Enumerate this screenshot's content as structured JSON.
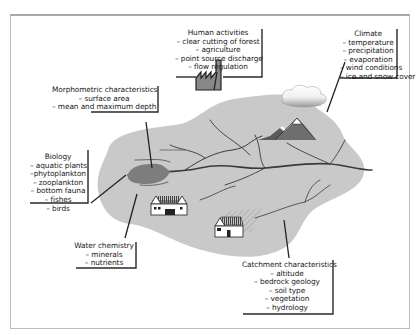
{
  "diagram": {
    "type": "lake catchment factors illustration",
    "colors": {
      "catchment_fill": "#c9c9c9",
      "lake_fill": "#7d7d7d",
      "river_stroke": "#3a3a3a",
      "label_shadow": "#2a2a2a",
      "frame_border": "#b0b0b0"
    },
    "labels": {
      "human": {
        "title": "Human activities",
        "items": [
          "– clear cutting of forest",
          "– agriculture",
          "– point source discharge",
          "– flow regulation"
        ]
      },
      "climate": {
        "title": "Climate",
        "items": [
          "– temperature",
          "– precipitation",
          "– evaporation",
          "– wind conditions",
          "– ice and snow cover"
        ]
      },
      "morphometric": {
        "title": "Morphometric characteristics",
        "items": [
          "– surface area",
          "– mean and maximum depth"
        ]
      },
      "biology": {
        "title": "Biology",
        "items": [
          "– aquatic plants",
          "–phytoplankton",
          "– zooplankton",
          "– bottom fauna",
          "– fishes",
          "– birds"
        ]
      },
      "water_chemistry": {
        "title": "Water chemistry",
        "items": [
          "– minerals",
          "– nutrients"
        ]
      },
      "catchment": {
        "title": "Catchment characteristics",
        "items": [
          "– altitude",
          "– bedrock geology",
          "– soil type",
          "– vegetation",
          "– hydrology"
        ]
      }
    },
    "icons": [
      "factory-icon",
      "cloud-icon",
      "rain-icon",
      "mountain-icon",
      "farmhouse-icon",
      "house-icon",
      "field-hatch-icon",
      "lake-shape",
      "river-network"
    ]
  }
}
